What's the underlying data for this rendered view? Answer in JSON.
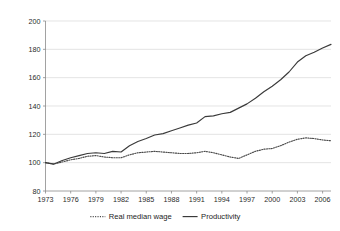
{
  "chart_data": {
    "type": "line",
    "title": "",
    "subtitle": "",
    "xlabel": "",
    "ylabel": "",
    "xlim": [
      1973,
      2007
    ],
    "ylim": [
      80,
      200
    ],
    "ytick_step": 20,
    "ytick_labels": [
      "200",
      "180",
      "160",
      "140",
      "120",
      "100",
      "80"
    ],
    "ytick_values": [
      200,
      180,
      160,
      140,
      120,
      100,
      80
    ],
    "xtick_labels": [
      "1973",
      "1976",
      "1979",
      "1982",
      "1985",
      "1988",
      "1991",
      "1994",
      "1997",
      "2000",
      "2003",
      "2006"
    ],
    "xtick_values": [
      1973,
      1976,
      1979,
      1982,
      1985,
      1988,
      1991,
      1994,
      1997,
      2000,
      2003,
      2006
    ],
    "grid": "horizontal",
    "legend_position": "bottom",
    "x": [
      1973,
      1974,
      1975,
      1976,
      1977,
      1978,
      1979,
      1980,
      1981,
      1982,
      1983,
      1984,
      1985,
      1986,
      1987,
      1988,
      1989,
      1990,
      1991,
      1992,
      1993,
      1994,
      1995,
      1996,
      1997,
      1998,
      1999,
      2000,
      2001,
      2002,
      2003,
      2004,
      2005,
      2006,
      2007
    ],
    "series": [
      {
        "name": "Real median wage",
        "style": "dotted",
        "color": "#4a4a4a",
        "values": [
          100.0,
          99.0,
          100.5,
          102.0,
          103.0,
          104.5,
          105.0,
          104.0,
          103.5,
          103.5,
          105.5,
          107.0,
          107.5,
          108.0,
          107.5,
          107.0,
          106.5,
          106.5,
          107.0,
          108.0,
          107.0,
          105.5,
          104.0,
          103.0,
          105.5,
          108.0,
          109.5,
          110.0,
          112.0,
          114.5,
          116.5,
          117.5,
          117.0,
          116.0,
          115.5
        ]
      },
      {
        "name": "Productivity",
        "style": "solid",
        "color": "#3a3a3a",
        "values": [
          100.0,
          99.0,
          101.5,
          103.5,
          105.0,
          106.5,
          107.0,
          106.5,
          108.0,
          107.5,
          112.0,
          115.0,
          117.0,
          119.5,
          120.5,
          122.5,
          124.5,
          126.5,
          128.0,
          132.5,
          133.0,
          134.5,
          135.5,
          138.5,
          141.5,
          145.5,
          150.0,
          154.0,
          158.5,
          164.0,
          171.0,
          175.5,
          178.0,
          181.0,
          183.5
        ]
      }
    ]
  },
  "legend": {
    "items": [
      {
        "label": "Real median wage",
        "style": "dotted"
      },
      {
        "label": "Productivity",
        "style": "solid"
      }
    ]
  }
}
